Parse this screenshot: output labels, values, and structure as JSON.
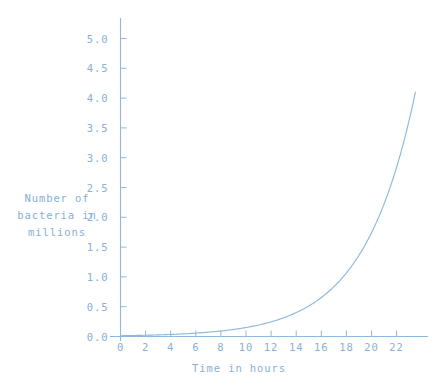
{
  "chart_data": {
    "type": "line",
    "title": "",
    "subtitle": "",
    "xlabel": "Time in hours",
    "ylabel": "Number of bacteria in millions",
    "ylabel_lines": [
      "Number of",
      "bacteria in",
      "millions"
    ],
    "xlim": [
      0,
      23.6
    ],
    "ylim": [
      0.0,
      5.4
    ],
    "xticks": [
      0,
      2,
      4,
      6,
      8,
      10,
      12,
      14,
      16,
      18,
      20,
      22
    ],
    "xtick_labels": [
      "0",
      "2",
      "4",
      "6",
      "8",
      "10",
      "12",
      "14",
      "16",
      "18",
      "20",
      "22"
    ],
    "yticks": [
      0.0,
      0.5,
      1.0,
      1.5,
      2.0,
      2.5,
      3.0,
      3.5,
      4.0,
      4.5,
      5.0
    ],
    "ytick_labels": [
      "0.0",
      "0.5",
      "1.0",
      "1.5",
      "2.0",
      "2.5",
      "3.0",
      "3.5",
      "4.0",
      "4.5",
      "5.0"
    ],
    "grid": false,
    "legend": false,
    "legend_position": "none",
    "series": [
      {
        "name": "bacteria population",
        "color": "#8fb8dc",
        "x": [
          0,
          1,
          2,
          3,
          4,
          5,
          6,
          7,
          8,
          9,
          10,
          11,
          12,
          13,
          14,
          15,
          16,
          17,
          18,
          19,
          20,
          21,
          22,
          23,
          23.6
        ],
        "values": [
          0.013,
          0.016,
          0.019,
          0.022,
          0.026,
          0.031,
          0.037,
          0.044,
          0.053,
          0.063,
          0.075,
          0.089,
          0.106,
          0.126,
          0.15,
          0.179,
          0.213,
          0.253,
          0.301,
          0.358,
          0.426,
          0.507,
          0.603,
          0.717,
          0.796
        ]
      }
    ],
    "curve_note": "exponential growth curve rising to about 4.1 million at the right edge of the axis",
    "endpoint_value": 4.1,
    "endpoint_x": 23.5
  },
  "colors": {
    "accent": "#8fb8dc",
    "text": "#86b0d6",
    "background": "#ffffff"
  }
}
